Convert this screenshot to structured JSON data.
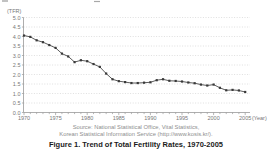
{
  "chart_data": {
    "type": "line",
    "title": "Figure 1. Trend of Total Fertility Rates, 1970-2005",
    "ylabel": "(TFR)",
    "xlabel": "(Year)",
    "ylim": [
      0.0,
      5.0
    ],
    "y_tick_step": 0.5,
    "y_ticks": [
      "0.0",
      "0.5",
      "1.0",
      "1.5",
      "2.0",
      "2.5",
      "3.0",
      "3.5",
      "4.0",
      "4.5",
      "5.0"
    ],
    "x_tick_labels": [
      "1970",
      "1975",
      "1980",
      "1985",
      "1990",
      "1995",
      "2000",
      "2005"
    ],
    "grid": "horizontal-dotted",
    "legend": "none",
    "line_color": "#4a4a4a",
    "marker": "square",
    "marker_color": "#383838",
    "axis_color": "#999999",
    "grid_color": "#c9c9c9",
    "x": [
      1970,
      1971,
      1972,
      1973,
      1974,
      1975,
      1976,
      1977,
      1978,
      1979,
      1980,
      1981,
      1982,
      1983,
      1984,
      1985,
      1986,
      1987,
      1988,
      1989,
      1990,
      1991,
      1992,
      1993,
      1994,
      1995,
      1996,
      1997,
      1998,
      1999,
      2000,
      2001,
      2002,
      2003,
      2004,
      2005
    ],
    "values": [
      4.05,
      3.98,
      3.8,
      3.7,
      3.55,
      3.4,
      3.1,
      2.95,
      2.65,
      2.75,
      2.7,
      2.55,
      2.4,
      2.05,
      1.75,
      1.65,
      1.6,
      1.55,
      1.55,
      1.57,
      1.59,
      1.7,
      1.75,
      1.67,
      1.66,
      1.63,
      1.58,
      1.54,
      1.47,
      1.42,
      1.47,
      1.3,
      1.17,
      1.19,
      1.16,
      1.08
    ]
  },
  "source": {
    "line1": "Source: National Statistical Office, Vital Statistics,",
    "line2": "Korean Statistical Information Service (http://www.kosis.kr/)."
  },
  "caption": "Figure 1. Trend of Total Fertility Rates, 1970-2005"
}
